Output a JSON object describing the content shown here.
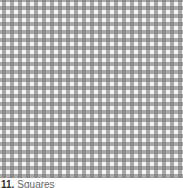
{
  "item": {
    "number": "11.",
    "label": "Squares",
    "pattern": "gingham-check",
    "colors": {
      "dark": "#8a8a8a",
      "light": "#f4f4f4"
    }
  }
}
